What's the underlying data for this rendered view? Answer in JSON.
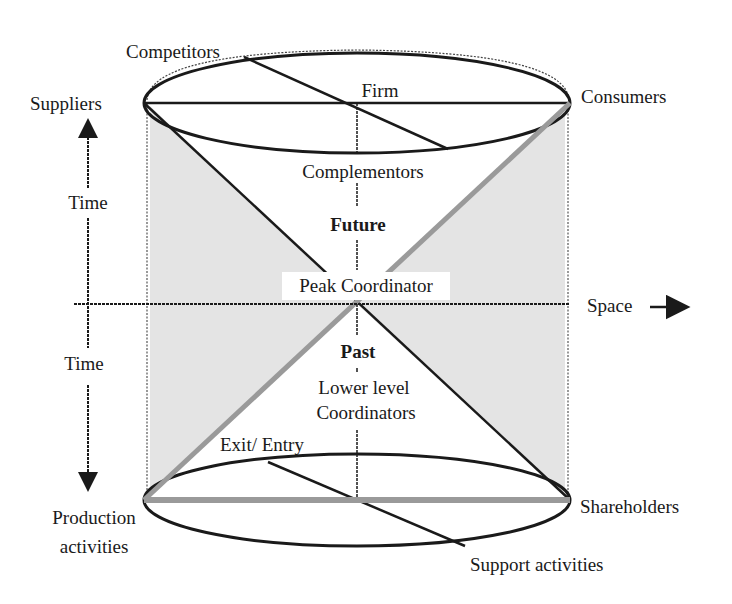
{
  "diagram": {
    "type": "cylinder-hourglass",
    "top_disc": {
      "center": "Firm",
      "left": "Suppliers",
      "right": "Consumers",
      "back": "Competitors",
      "front": "Complementors"
    },
    "bottom_disc": {
      "left_line1": "Production",
      "left_line2": "activities",
      "right": "Shareholders",
      "back": "Exit/ Entry",
      "front": "Support activities"
    },
    "center": {
      "upper_cone": "Future",
      "apex": "Peak Coordinator",
      "lower_cone": "Past",
      "lower_line1": "Lower level",
      "lower_line2": "Coordinators"
    },
    "axes": {
      "time_up": "Time",
      "time_down": "Time",
      "space": "Space"
    },
    "colors": {
      "ink": "#1a1a1a",
      "shade": "#e4e4e4",
      "gray_line": "#9a9a9a"
    }
  }
}
